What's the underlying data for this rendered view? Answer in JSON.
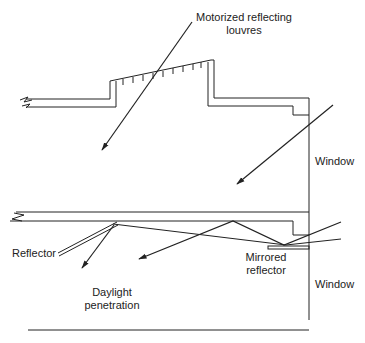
{
  "diagram": {
    "labels": {
      "louvres_line1": "Motorized reflecting",
      "louvres_line2": "louvres",
      "window_upper": "Window",
      "window_lower": "Window",
      "reflector": "Reflector",
      "mirrored_line1": "Mirrored",
      "mirrored_line2": "reflector",
      "daylight_line1": "Daylight",
      "daylight_line2": "penetration"
    },
    "colors": {
      "line": "#222222",
      "background": "#ffffff"
    }
  }
}
